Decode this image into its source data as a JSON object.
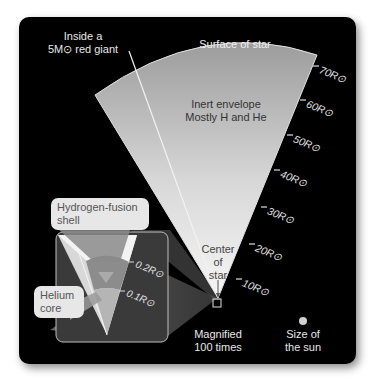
{
  "title": {
    "line1": "Inside a",
    "line2": "5M⊙ red giant"
  },
  "labels": {
    "surface": "Surface of star",
    "envelope_line1": "Inert envelope",
    "envelope_line2": "Mostly H and He",
    "center_line1": "Center",
    "center_line2": "of",
    "center_line3": "star",
    "magnified_line1": "Magnified",
    "magnified_line2": "100 times",
    "sun_line1": "Size of",
    "sun_line2": "the sun"
  },
  "callouts": {
    "hydrogen_shell_line1": "Hydrogen-fusion",
    "hydrogen_shell_line2": "shell",
    "helium_core_line1": "Helium",
    "helium_core_line2": "core"
  },
  "scale_ticks": [
    "70R⊙",
    "60R⊙",
    "50R⊙",
    "40R⊙",
    "30R⊙",
    "20R⊙",
    "10R⊙"
  ],
  "inset_ticks": [
    "0.2R⊙",
    "0.1R⊙"
  ],
  "colors": {
    "background": "#000000",
    "wedge_top": "#9a9a9a",
    "wedge_bottom": "#f4f4f4",
    "callout_bg": "#e7e7e7",
    "text": "#e8e8e8"
  }
}
